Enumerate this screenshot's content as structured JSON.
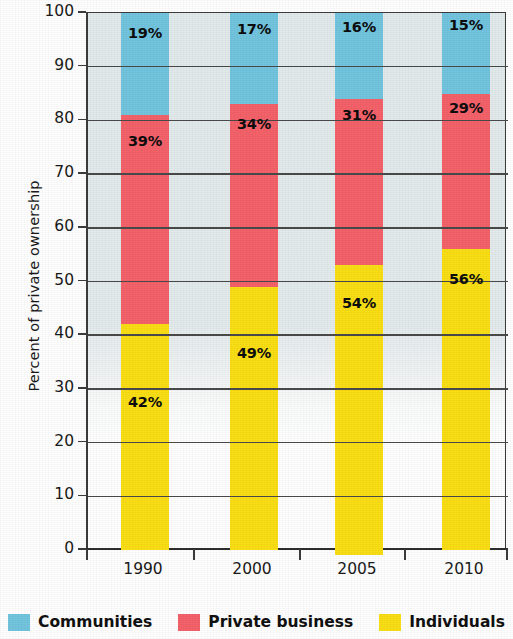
{
  "chart_data": {
    "type": "bar",
    "subtype": "stacked-100-percent",
    "title": "",
    "xlabel": "",
    "ylabel": "Percent of private ownership",
    "categories": [
      "1990",
      "2000",
      "2005",
      "2010"
    ],
    "ylim": [
      0,
      100
    ],
    "ytick_labels": [
      "0",
      "10",
      "20",
      "30",
      "40",
      "50",
      "60",
      "70",
      "80",
      "90",
      "100"
    ],
    "ytick_values": [
      0,
      10,
      20,
      30,
      40,
      50,
      60,
      70,
      80,
      90,
      100
    ],
    "grid": true,
    "grid_axis": "y",
    "legend_position": "bottom",
    "stack_order_bottom_to_top": [
      "Individuals",
      "Private business",
      "Communities"
    ],
    "series": [
      {
        "name": "Individuals",
        "color": "#fadf15",
        "values": [
          42,
          49,
          54,
          56
        ],
        "labels": [
          "42%",
          "49%",
          "54%",
          "56%"
        ]
      },
      {
        "name": "Private business",
        "color": "#f5626a",
        "values": [
          39,
          34,
          31,
          29
        ],
        "labels": [
          "39%",
          "34%",
          "31%",
          "29%"
        ]
      },
      {
        "name": "Communities",
        "color": "#72c5de",
        "values": [
          19,
          17,
          16,
          15
        ],
        "labels": [
          "19%",
          "17%",
          "16%",
          "15%"
        ]
      }
    ],
    "legend_entries": [
      {
        "label": "Communities",
        "color": "#72c5de"
      },
      {
        "label": "Private business",
        "color": "#f5626a"
      },
      {
        "label": "Individuals",
        "color": "#fadf15"
      }
    ],
    "plot_background_color": "#e4ebed",
    "axis_color": "#3c3c3c",
    "gridline_color": "#4a4a4a"
  },
  "yaxis": {
    "title": "Percent of private ownership",
    "ticks": [
      {
        "label": "100",
        "value": 100
      },
      {
        "label": "90",
        "value": 90
      },
      {
        "label": "80",
        "value": 80
      },
      {
        "label": "70",
        "value": 70
      },
      {
        "label": "60",
        "value": 60
      },
      {
        "label": "50",
        "value": 50
      },
      {
        "label": "40",
        "value": 40
      },
      {
        "label": "30",
        "value": 30
      },
      {
        "label": "20",
        "value": 20
      },
      {
        "label": "10",
        "value": 10
      },
      {
        "label": "0",
        "value": 0
      }
    ]
  },
  "xaxis": {
    "ticks": [
      {
        "label": "1990"
      },
      {
        "label": "2000"
      },
      {
        "label": "2005"
      },
      {
        "label": "2010"
      }
    ]
  },
  "bars": [
    {
      "category": "1990",
      "segments": [
        {
          "series": "Communities",
          "value": 19,
          "label": "19%",
          "color": "#72c5de"
        },
        {
          "series": "Private business",
          "value": 39,
          "label": "39%",
          "color": "#f5626a"
        },
        {
          "series": "Individuals",
          "value": 42,
          "label": "42%",
          "color": "#fadf15"
        }
      ]
    },
    {
      "category": "2000",
      "segments": [
        {
          "series": "Communities",
          "value": 17,
          "label": "17%",
          "color": "#72c5de"
        },
        {
          "series": "Private business",
          "value": 34,
          "label": "34%",
          "color": "#f5626a"
        },
        {
          "series": "Individuals",
          "value": 49,
          "label": "49%",
          "color": "#fadf15"
        }
      ]
    },
    {
      "category": "2005",
      "segments": [
        {
          "series": "Communities",
          "value": 16,
          "label": "16%",
          "color": "#72c5de"
        },
        {
          "series": "Private business",
          "value": 31,
          "label": "31%",
          "color": "#f5626a"
        },
        {
          "series": "Individuals",
          "value": 54,
          "label": "54%",
          "color": "#fadf15"
        }
      ]
    },
    {
      "category": "2010",
      "segments": [
        {
          "series": "Communities",
          "value": 15,
          "label": "15%",
          "color": "#72c5de"
        },
        {
          "series": "Private business",
          "value": 29,
          "label": "29%",
          "color": "#f5626a"
        },
        {
          "series": "Individuals",
          "value": 56,
          "label": "56%",
          "color": "#fadf15"
        }
      ]
    }
  ],
  "legend": {
    "items": [
      {
        "label": "Communities",
        "color": "#72c5de"
      },
      {
        "label": "Private business",
        "color": "#f5626a"
      },
      {
        "label": "Individuals",
        "color": "#fadf15"
      }
    ]
  }
}
